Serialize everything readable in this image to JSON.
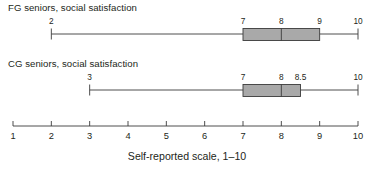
{
  "figure": {
    "width": 374,
    "height": 170,
    "background": "#ffffff",
    "stroke_color": "#3b3b3b",
    "box_fill": "#a9a9a9",
    "box_stroke": "#3b3b3b",
    "text_color": "#231f20"
  },
  "axis": {
    "label": "Self-reported scale, 1–10",
    "min": 1,
    "max": 10,
    "ticks": [
      1,
      2,
      3,
      4,
      5,
      6,
      7,
      8,
      9,
      10
    ],
    "tick_labels": [
      "1",
      "2",
      "3",
      "4",
      "5",
      "6",
      "7",
      "8",
      "9",
      "10"
    ],
    "pixel_left": 13,
    "pixel_right": 358
  },
  "panels": [
    {
      "id": "fg",
      "title": "FG seniors, social satisfaction",
      "min": 2,
      "q1": 7,
      "median": 8,
      "q3": 9,
      "max": 10,
      "value_labels": [
        {
          "text": "2",
          "value": 2
        },
        {
          "text": "7",
          "value": 7
        },
        {
          "text": "8",
          "value": 8
        },
        {
          "text": "9",
          "value": 9
        },
        {
          "text": "10",
          "value": 10
        }
      ]
    },
    {
      "id": "cg",
      "title": "CG seniors, social satisfaction",
      "min": 3,
      "q1": 7,
      "median": 8,
      "q3": 8.5,
      "max": 10,
      "value_labels": [
        {
          "text": "3",
          "value": 3
        },
        {
          "text": "7",
          "value": 7
        },
        {
          "text": "8",
          "value": 8
        },
        {
          "text": "8.5",
          "value": 8.5
        },
        {
          "text": "10",
          "value": 10
        }
      ]
    }
  ],
  "chart_data": {
    "type": "boxplot",
    "title": "",
    "xlabel": "Self-reported scale, 1–10",
    "ylabel": "",
    "xlim": [
      1,
      10
    ],
    "grid": false,
    "legend": "none",
    "orientation": "horizontal",
    "xticks": [
      1,
      2,
      3,
      4,
      5,
      6,
      7,
      8,
      9,
      10
    ],
    "xticklabels": [
      "1",
      "2",
      "3",
      "4",
      "5",
      "6",
      "7",
      "8",
      "9",
      "10"
    ],
    "series": [
      {
        "name": "FG seniors, social satisfaction",
        "whisker_low": 2,
        "q1": 7,
        "median": 8,
        "q3": 9,
        "whisker_high": 10,
        "outliers": []
      },
      {
        "name": "CG seniors, social satisfaction",
        "whisker_low": 3,
        "q1": 7,
        "median": 8,
        "q3": 8.5,
        "whisker_high": 10,
        "outliers": []
      }
    ]
  }
}
